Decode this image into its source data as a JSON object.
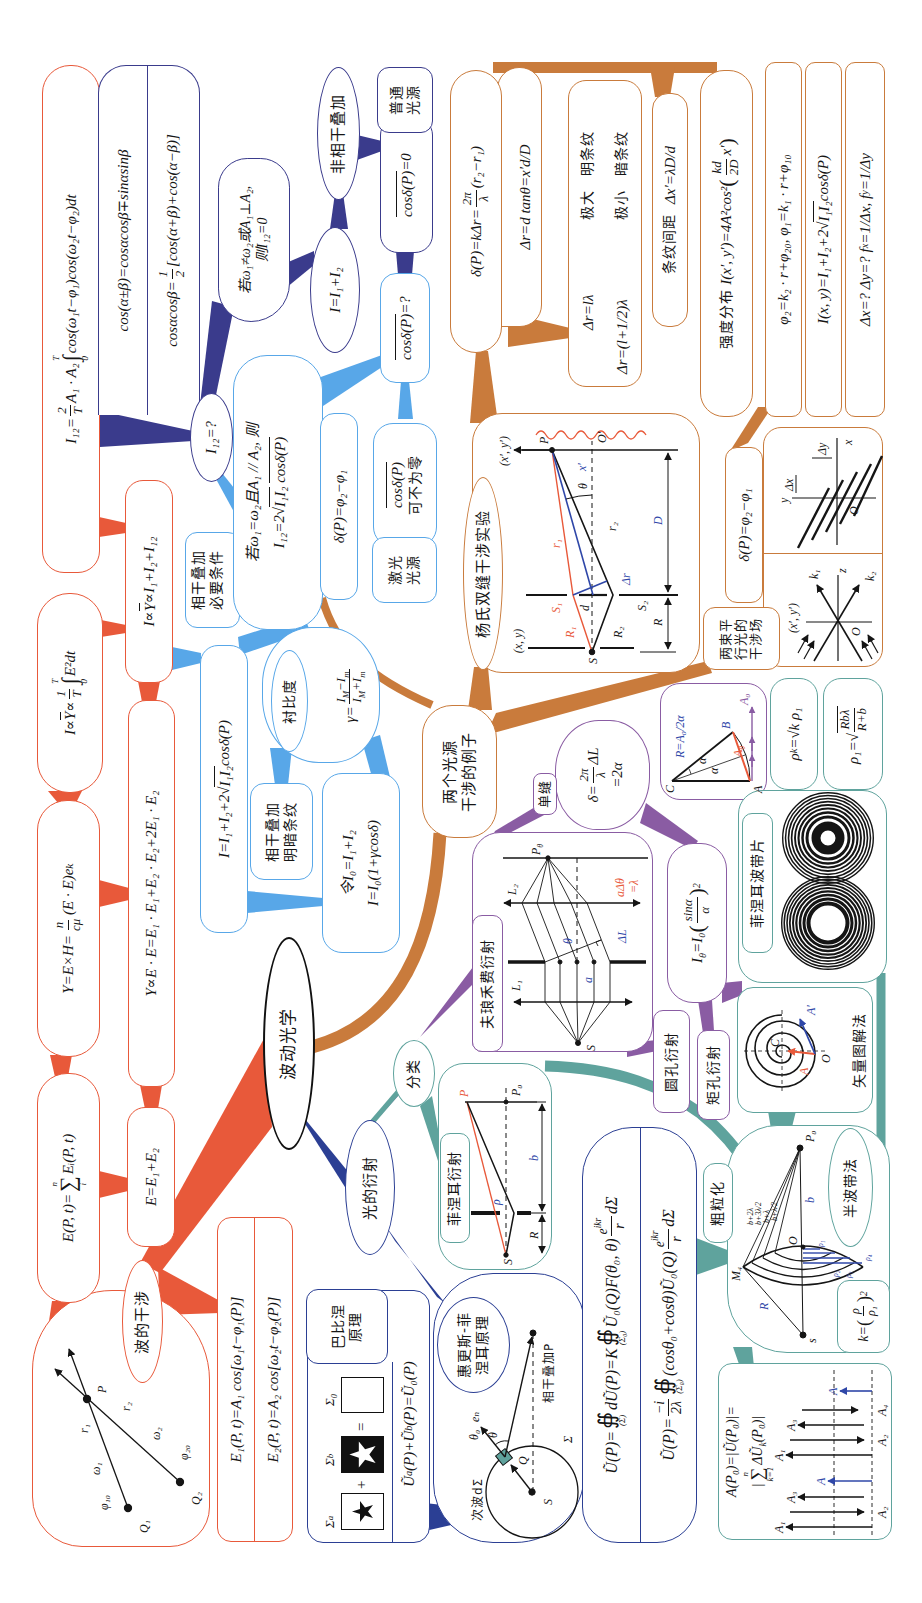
{
  "root": {
    "label": "波动光学"
  },
  "colors": {
    "interference": "#e8593a",
    "incoherent": "#3a3b8c",
    "coherence": "#58a7e8",
    "examples": "#c97b3c",
    "diffraction": "#2b3f94",
    "fresnel": "#5fa39d",
    "fraunhofer": "#8a5ca3"
  },
  "wave": {
    "label": "波的干涉",
    "diagram": {
      "q1": "Q₁",
      "q2": "Q₂",
      "p": "P",
      "phi10": "φ₁₀",
      "phi20": "φ₂₀",
      "w1": "ω₁",
      "w2": "ω₂",
      "r1": "r₁",
      "r2": "r₂"
    },
    "equations": [
      "E₁(P, t)=A₁ cos[ω₁t−φ₁(P)]",
      "E₂(P, t)=A₂ cos[ω₂t−φ₂(P)]"
    ],
    "field_sum": {
      "lhs": "E(P, t)=",
      "op": "∑",
      "upper": "n",
      "lower": "i",
      "rhs": "Eᵢ(P, t)"
    },
    "field_pair": "E=E₁+E₂",
    "poynting": {
      "lhs": "Y=E×H=",
      "num": "n",
      "den": "cμ",
      "rhs": "(E · E)eₖ"
    },
    "energy": "Y∝E · E=E₁ · E₁+E₂ · E₂+2E₁ · E₂",
    "intensity_avg": {
      "lhs": "I∝¯{Y}∝",
      "num": "1",
      "den": "T",
      "op": "∫",
      "upper": "T",
      "lower": "0",
      "rhs": "E²dt"
    },
    "intensity_sum": "I∝¯{Y}∝I₁+I₂+I₁₂",
    "cross_term": {
      "lhs": "I₁₂=",
      "num": "2",
      "den": "T",
      "mid": "A₁ · A₂",
      "op": "∫",
      "upper": "T",
      "lower": "0",
      "rhs": "cos(ω₁t−φ₁)cos(ω₂t−φ₂)dt"
    },
    "trig": {
      "sum_formula": "cos(α±β)=cosαcosβ∓sinαsinβ",
      "product": {
        "lhs": "cosαcosβ=",
        "num": "1",
        "den": "2",
        "rhs": "[cos(α+β)+cos(α−β)]"
      }
    },
    "cross_question": "I₁₂=?"
  },
  "incoherent": {
    "condition": [
      "若ω₁≠ω₂或A₁⊥A₂,",
      "则I₁₂=0"
    ],
    "sum": "I=I₁+I₂",
    "label": "非相干叠加",
    "avg": "¯{cosδ(P)}=0",
    "source": [
      "普通",
      "光源"
    ]
  },
  "coherent": {
    "label": [
      "相干叠加",
      "必要条件"
    ],
    "condition": "若ω₁=ω₂且A₁ // A₂, 则",
    "cross": {
      "pre": "I₁₂=2√",
      "rad": "I₁I₂",
      "post": "cosδ(P)"
    },
    "phase": "δ(P)=φ₂−φ₁",
    "avg_question": "¯{cosδ(P)}=?",
    "avg_nonzero": [
      "¯{cosδ(P)}",
      "可不为零"
    ],
    "source": [
      "激光",
      "光源"
    ],
    "total": {
      "pre": "I=I₁+I₂+2√",
      "rad": "I₁I₂",
      "post": " cosδ(P)"
    },
    "fringes": [
      "相干叠加",
      "明暗条纹"
    ],
    "contrast": {
      "label": "衬比度",
      "lhs": "γ=",
      "num": "I_{M}−I_{m}",
      "den": "I_{M}+I_{m}"
    },
    "normalized": [
      "令I₀=I₁+I₂",
      "I=I₀(1+γcosδ)"
    ]
  },
  "examples": {
    "label": [
      "两个光源",
      "干涉的例子"
    ],
    "young": {
      "label": "杨氏双缝干涉实验",
      "diagram": {
        "S": "S",
        "S1": "S₁",
        "S2": "S₂",
        "R1": "R₁",
        "R2": "R₂",
        "r1": "r₁",
        "r2": "r₂",
        "d": "d",
        "D": "D",
        "R": "R",
        "dr": "Δr",
        "theta": "θ",
        "xp": "x′",
        "P": "P",
        "O": "O′",
        "src_coords": "(x, y)",
        "scr_coords": "(x′, y′)"
      },
      "phase": {
        "lhs": "δ(P)=kΔr=",
        "num": "2π",
        "den": "λ",
        "rhs": "(r₂−r₁)"
      },
      "path_diff": "Δr=d tanθ=x′d/D",
      "conditions": [
        {
          "expr": "Δr=lλ",
          "extreme": "极大",
          "fringe": "明条纹"
        },
        {
          "expr": "Δr=(l+1/2)λ",
          "extreme": "极小",
          "fringe": "暗条纹"
        }
      ],
      "spacing": {
        "label": "条纹间距",
        "expr": "Δx′=λD/d"
      },
      "intensity": {
        "label": "强度分布",
        "lhs": "I(x′, y′)=4A²cos²",
        "lp": "(",
        "num": "kd",
        "den": "2D",
        "rhs": "x′",
        "rp": ")"
      }
    },
    "plane": {
      "label": [
        "两束平",
        "行光的",
        "干涉场"
      ],
      "phase_diff": "δ(P)=φ₂−φ₁",
      "phases": "φ₂=k₂ · r+φ₂₀, φ₁=k₁ · r+φ₁₀",
      "intensity": {
        "pre": "I(x, y)=I₁+I₂+2√",
        "rad": "I₁I₂",
        "post": " cosδ(P)"
      },
      "spacing": "Δx=? Δy=? f_{x}=1/Δx, f_{y}=1/Δy",
      "fringe_fig": {
        "y": "y",
        "x": "x",
        "O": "O",
        "dx": "Δx",
        "dy": "Δy"
      },
      "wave_fig": {
        "k1": "k₁",
        "k2": "k₂",
        "z": "z",
        "O": "O",
        "coords": "(x′, y′)"
      }
    }
  },
  "diffraction": {
    "label": "光的衍射",
    "huygens": {
      "label": [
        "惠更斯-菲",
        "涅耳原理"
      ],
      "diagram": {
        "S": "S",
        "Q": "Q",
        "P": "P",
        "sigma": "Σ",
        "secondary": "次波dΣ",
        "theta0": "θ₀",
        "theta": "θ",
        "en": "eₙ",
        "coherent": "相干叠加P"
      },
      "kirchhoff1": {
        "lhs": "Ũ(P)=",
        "op1": "∯",
        "sub1": "(Σ)",
        "mid": "dŨ(P)=K",
        "op2": "∯",
        "sub2": "(Σ₀)",
        "body": "Ũ₀(Q)F(θ₀, θ)",
        "num": "e^{ikr}",
        "den": "r",
        "tail": "dΣ"
      },
      "kirchhoff2": {
        "lhs": "Ũ(P)=",
        "num1": "−i",
        "den1": "2λ",
        "op": "∯",
        "sub": "(Σ₀)",
        "body": "(cosθ₀+cosθ)Ũ₀(Q)",
        "num2": "e^{ikr}",
        "den2": "r",
        "tail": "dΣ"
      }
    },
    "babinet": {
      "label": [
        "巴比涅",
        "原理"
      ],
      "sigma_a": "Σ_{a}",
      "sigma_b": "Σ_{b}",
      "sigma_0": "Σ₀",
      "plus": "+",
      "equals": "=",
      "formula": "Ũ_{a}(P)+Ũ_{b}(P)=Ũ₀(P)"
    },
    "classification": "分类",
    "fresnel": {
      "label": "菲涅耳衍射",
      "diagram": {
        "S": "S",
        "P": "P",
        "P0": "P₀",
        "rho": "ρ",
        "R": "R",
        "b": "b"
      }
    },
    "fraunhofer": {
      "label": "夫琅禾费衍射",
      "diagram": {
        "S": "S",
        "L1": "L₁",
        "L2": "L₂",
        "P": "P",
        "P_sub": "θ",
        "theta": "θ",
        "a": "a",
        "dL": "ΔL",
        "cond1": "aΔθ",
        "cond2": "=λ"
      }
    },
    "single_slit": {
      "label": "单缝",
      "phase": {
        "lhs": "δ=",
        "num": "2π",
        "den": "λ",
        "rhs": "ΔL"
      },
      "phase2": "=2α",
      "phasor": {
        "C": "C",
        "A": "A",
        "B": "B",
        "R": "R=A₀/2α",
        "A0": "A₀",
        "At": "A",
        "At_sub": "θ",
        "alpha1": "α",
        "alpha2": "α"
      },
      "intensity": {
        "lhs": "I_{θ}=I₀",
        "lp": "(",
        "num": "sinα",
        "den": "α",
        "rp": ")",
        "exp": "2"
      }
    },
    "circular": "圆孔衍射",
    "rectangular": "矩孔衍射",
    "vector": {
      "label": "矢量图解法",
      "C": "C",
      "O": "O",
      "A": "A",
      "Ap": "A′"
    },
    "zone_plate": {
      "label": "菲涅耳波带片"
    },
    "zone_radius": "ρ_{k}=√k ρ₁",
    "first_radius": {
      "lhs": "ρ₁=√",
      "num": "Rbλ",
      "den": "R+b"
    },
    "coarse": "粗粒化",
    "half_zone": {
      "label": "半波带法",
      "k": {
        "lhs": "k=",
        "lp": "(",
        "num": "ρ",
        "den": "ρ₁",
        "rp": ")",
        "exp": "2"
      },
      "diagram": {
        "P0": "P₀",
        "s": "s",
        "O": "O",
        "b": "b",
        "R": "R",
        "M4": "M₄",
        "paths": [
          "b+2λ",
          "b+3λ/2",
          "b+λ",
          "b+λ/2"
        ],
        "rhos": [
          "ρ₁",
          "ρ₂",
          "ρ₃",
          "ρ₄"
        ]
      }
    },
    "amplitude": {
      "line1": "A(P₀)=|Ũ(P₀)|=",
      "bar": "|",
      "op": "∑",
      "upper": "n",
      "lower": "k=1",
      "term": "ΔŨ_{k}(P₀)|",
      "labels": [
        "A₁",
        "A₂",
        "A₃",
        "A",
        "A₁",
        "A₂",
        "A₃",
        "A₄",
        "A"
      ]
    }
  }
}
